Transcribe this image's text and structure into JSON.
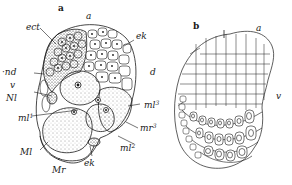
{
  "figure": {
    "panel_a": {
      "title": "a",
      "labels": {
        "a": "a",
        "ect": "ect",
        "ek_top": "ek",
        "end": "·nd",
        "v": "v",
        "Nl": "Nl",
        "ml1": "ml",
        "ml1_sup": "1",
        "Ml": "Ml",
        "Mr": "Mr",
        "ek_bottom": "ek",
        "ml2": "ml",
        "ml2_sup": "2",
        "mr3": "mr",
        "mr3_sup": "3",
        "ml3": "ml",
        "ml3_sup": "3",
        "d": "d"
      }
    },
    "panel_b": {
      "title": "b",
      "labels": {
        "a": "a",
        "v": "v"
      }
    },
    "colors": {
      "ink": "#1a1a1a",
      "background": "#ffffff"
    }
  }
}
